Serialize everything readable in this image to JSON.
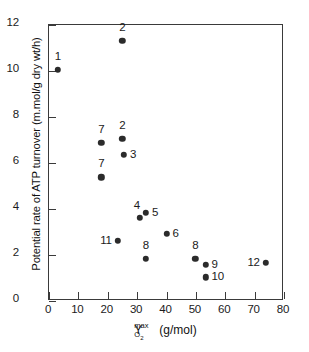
{
  "chart_data": {
    "type": "scatter",
    "title": "",
    "xlabel": "Y(max, O2) (g/mol)",
    "ylabel": "Potential rate of ATP turnover (m.mol/g dry wt/h)",
    "xlim": [
      0,
      80
    ],
    "ylim": [
      0,
      12
    ],
    "xticks": [
      0,
      10,
      20,
      30,
      40,
      50,
      60,
      70,
      80
    ],
    "yticks": [
      0,
      2,
      4,
      6,
      8,
      10,
      12
    ],
    "grid": false,
    "legend": false,
    "x_axis_symbol": {
      "base": "Y",
      "superscript": "max",
      "subscript": "O",
      "subscript_digit": "2",
      "units": "(g/mol)"
    },
    "points": [
      {
        "label": "1",
        "x": 3.0,
        "y": 10.05,
        "label_pos": "above"
      },
      {
        "label": "2",
        "x": 25.0,
        "y": 11.3,
        "label_pos": "above"
      },
      {
        "label": "7",
        "x": 17.8,
        "y": 6.88,
        "label_pos": "above"
      },
      {
        "label": "2",
        "x": 25.0,
        "y": 7.05,
        "label_pos": "above"
      },
      {
        "label": "3",
        "x": 25.5,
        "y": 6.35,
        "label_pos": "right"
      },
      {
        "label": "7",
        "x": 17.8,
        "y": 5.38,
        "label_pos": "above"
      },
      {
        "label": "4",
        "x": 31.0,
        "y": 3.63,
        "label_pos": "above-left"
      },
      {
        "label": "5",
        "x": 33.0,
        "y": 3.83,
        "label_pos": "right"
      },
      {
        "label": "6",
        "x": 40.0,
        "y": 2.92,
        "label_pos": "right"
      },
      {
        "label": "11",
        "x": 23.4,
        "y": 2.63,
        "label_pos": "left"
      },
      {
        "label": "8",
        "x": 33.0,
        "y": 1.83,
        "label_pos": "above"
      },
      {
        "label": "8",
        "x": 49.8,
        "y": 1.83,
        "label_pos": "above"
      },
      {
        "label": "9",
        "x": 53.3,
        "y": 1.57,
        "label_pos": "right"
      },
      {
        "label": "10",
        "x": 53.3,
        "y": 1.03,
        "label_pos": "right"
      },
      {
        "label": "12",
        "x": 73.8,
        "y": 1.67,
        "label_pos": "left"
      }
    ],
    "colors": {
      "marker": "#2b2b2b",
      "axis": "#3a3a3a",
      "text": "#1b1b1b",
      "background": "#ffffff"
    }
  }
}
